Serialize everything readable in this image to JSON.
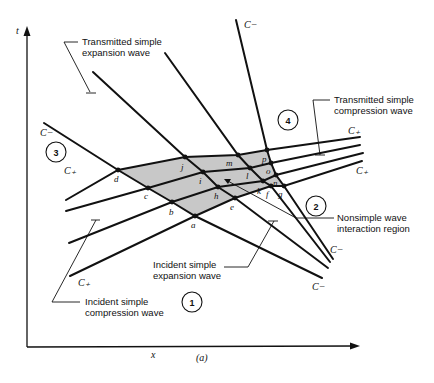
{
  "figure": {
    "caption": "(a)",
    "axes": {
      "x_label": "x",
      "y_label": "t"
    },
    "shading_color": "#c8c8c8",
    "line_color": "#111111",
    "regions": [
      {
        "id": "1",
        "label": "1"
      },
      {
        "id": "2",
        "label": "2"
      },
      {
        "id": "3",
        "label": "3"
      },
      {
        "id": "4",
        "label": "4"
      }
    ],
    "characteristic_labels": {
      "c_minus": "C−",
      "c_plus": "C₊"
    },
    "annotations": {
      "transmitted_expansion_line1": "Transmitted simple",
      "transmitted_expansion_line2": "expansion wave",
      "transmitted_compression_line1": "Transmitted simple",
      "transmitted_compression_line2": "compression wave",
      "nonsimple_line1": "Nonsimple wave",
      "nonsimple_line2": "interaction region",
      "incident_expansion_line1": "Incident simple",
      "incident_expansion_line2": "expansion wave",
      "incident_compression_line1": "Incident simple",
      "incident_compression_line2": "compression wave"
    },
    "points": {
      "a": "a",
      "b": "b",
      "c": "c",
      "d": "d",
      "e": "e",
      "f": "f",
      "g": "g",
      "h": "h",
      "i": "i",
      "j": "j",
      "k": "k",
      "l": "l",
      "m": "m",
      "n": "n",
      "o": "o",
      "p": "p"
    }
  }
}
